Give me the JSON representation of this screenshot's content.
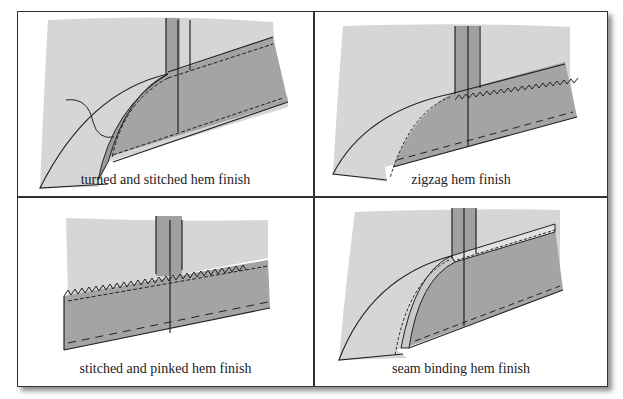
{
  "figure": {
    "panels": [
      {
        "id": "turned-stitched",
        "caption": "turned and stitched hem finish"
      },
      {
        "id": "zigzag",
        "caption": "zigzag hem finish"
      },
      {
        "id": "stitched-pinked",
        "caption": "stitched and pinked hem finish"
      },
      {
        "id": "seam-binding",
        "caption": "seam binding hem finish"
      }
    ]
  },
  "colors": {
    "fabric_light": "#d6d6d6",
    "fabric_dark": "#a4a4a4",
    "seam_strip": "#9a9a9a",
    "line": "#222222",
    "border": "#333333"
  }
}
